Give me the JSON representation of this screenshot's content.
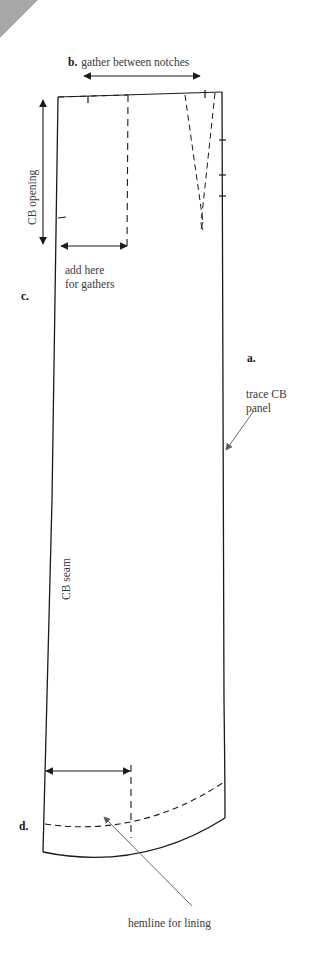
{
  "figure": {
    "background_color": "#ffffff",
    "line_color": "#1a1a1a",
    "corner_fold_color": "#a8a8a8"
  },
  "labels": {
    "step_b": "b.",
    "gather_between_notches": "gather between notches",
    "cb_opening": "CB opening",
    "add_here_line1": "add here",
    "add_here_line2": "for gathers",
    "step_c": "c.",
    "step_a": "a.",
    "trace_line1": "trace CB",
    "trace_line2": "panel",
    "cb_seam": "CB seam",
    "step_d": "d.",
    "hemline_for_lining": "hemline for lining"
  },
  "icons": {
    "corner_fold": "page-corner-fold-icon",
    "arrow_double_horizontal_top": "double-headed-arrow-icon",
    "arrow_double_vertical_cb_opening": "double-headed-arrow-icon",
    "arrow_double_horizontal_gathers": "double-headed-arrow-icon",
    "arrow_double_horizontal_hem": "double-headed-arrow-icon",
    "arrow_pointer_trace_cb": "pointer-arrow-icon",
    "arrow_pointer_hemline": "pointer-arrow-icon"
  },
  "geometry": {
    "panel_outline": {
      "top_left": [
        58,
        97
      ],
      "top_right": [
        222,
        92
      ],
      "bottom_right": [
        225,
        818
      ],
      "bottom_left": [
        43,
        852
      ],
      "note": "CB panel traced outline, solid"
    },
    "dashed_vertical_upper": {
      "x": 128,
      "y_top": 95,
      "y_bottom": 250
    },
    "dashed_vertical_lower": {
      "x": 131,
      "y_top": 765,
      "y_bottom": 838
    },
    "dart": {
      "apex": [
        203,
        222
      ],
      "left_top": [
        185,
        95
      ],
      "right_top": [
        215,
        93
      ]
    },
    "hemline_dashed": {
      "from": [
        45,
        822
      ],
      "to": [
        224,
        782
      ]
    },
    "notches": [
      {
        "x": 88,
        "y": 99,
        "edge": "top"
      },
      {
        "x": 205,
        "y": 94,
        "edge": "top"
      },
      {
        "x": 62,
        "y": 218,
        "edge": "left"
      },
      {
        "x": 223,
        "y": 140,
        "edge": "right"
      },
      {
        "x": 223,
        "y": 175,
        "edge": "right"
      },
      {
        "x": 224,
        "y": 196,
        "edge": "right"
      }
    ],
    "arrows": {
      "gather_span": {
        "x1": 84,
        "x2": 200,
        "y": 76
      },
      "cb_opening_span": {
        "x": 43,
        "y1": 100,
        "y2": 244
      },
      "gathers_span": {
        "x1": 61,
        "x2": 127,
        "y": 246
      },
      "hem_span": {
        "x1": 46,
        "x2": 130,
        "y": 771
      },
      "trace_pointer": {
        "from": [
          246,
          414
        ],
        "to": [
          226,
          447
        ]
      },
      "hemline_pointer": {
        "from": [
          190,
          905
        ],
        "to": [
          104,
          817
        ]
      }
    }
  }
}
